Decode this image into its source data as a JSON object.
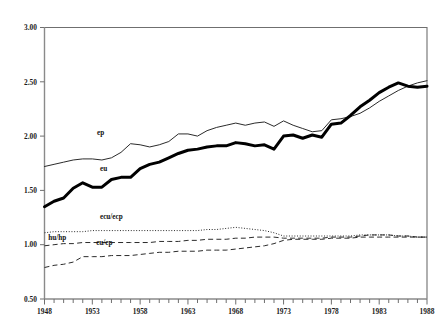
{
  "chart_data": {
    "type": "line",
    "title": "",
    "subtitle": "",
    "xlabel": "",
    "ylabel": "",
    "xlim": [
      1948,
      1988
    ],
    "ylim": [
      0.5,
      3.0
    ],
    "grid": false,
    "legend_position": "inline-labels",
    "y_ticks": [
      "0.50",
      "1.00",
      "1.50",
      "2.00",
      "2.50",
      "3.00"
    ],
    "y_tick_values": [
      0.5,
      1.0,
      1.5,
      2.0,
      2.5,
      3.0
    ],
    "x_ticks": [
      "1948",
      "1953",
      "1958",
      "1963",
      "1968",
      "1973",
      "1978",
      "1983",
      "1988"
    ],
    "x_tick_values": [
      1948,
      1953,
      1958,
      1963,
      1968,
      1973,
      1978,
      1983,
      1988
    ],
    "x_minor_tick_step": 1,
    "x": [
      1948,
      1949,
      1950,
      1951,
      1952,
      1953,
      1954,
      1955,
      1956,
      1957,
      1958,
      1959,
      1960,
      1961,
      1962,
      1963,
      1964,
      1965,
      1966,
      1967,
      1968,
      1969,
      1970,
      1971,
      1972,
      1973,
      1974,
      1975,
      1976,
      1977,
      1978,
      1979,
      1980,
      1981,
      1982,
      1983,
      1984,
      1985,
      1986,
      1987,
      1988
    ],
    "series": [
      {
        "name": "ep",
        "label": "ep",
        "style": "thin-solid",
        "color": "#2b2b2b",
        "label_x": 1953.5,
        "label_y": 2.01,
        "values": [
          1.72,
          1.74,
          1.76,
          1.78,
          1.79,
          1.79,
          1.78,
          1.8,
          1.85,
          1.93,
          1.92,
          1.9,
          1.92,
          1.95,
          2.02,
          2.02,
          2.0,
          2.05,
          2.08,
          2.1,
          2.12,
          2.1,
          2.12,
          2.13,
          2.09,
          2.14,
          2.1,
          2.07,
          2.04,
          2.05,
          2.15,
          2.16,
          2.18,
          2.21,
          2.26,
          2.32,
          2.37,
          2.42,
          2.46,
          2.49,
          2.51
        ]
      },
      {
        "name": "eu",
        "label": "eu",
        "style": "thick-solid",
        "color": "#000000",
        "label_x": 1953.8,
        "label_y": 1.68,
        "values": [
          1.35,
          1.4,
          1.43,
          1.52,
          1.57,
          1.53,
          1.53,
          1.6,
          1.62,
          1.62,
          1.7,
          1.74,
          1.76,
          1.8,
          1.84,
          1.87,
          1.88,
          1.9,
          1.91,
          1.91,
          1.94,
          1.93,
          1.91,
          1.92,
          1.88,
          2.0,
          2.01,
          1.98,
          2.01,
          1.99,
          2.11,
          2.12,
          2.19,
          2.27,
          2.33,
          2.4,
          2.45,
          2.49,
          2.46,
          2.45,
          2.46
        ]
      },
      {
        "name": "ecu/ecp",
        "label": "ecu/ecp",
        "style": "dotted",
        "color": "#2b2b2b",
        "label_x": 1953.8,
        "label_y": 1.24,
        "values": [
          1.11,
          1.12,
          1.12,
          1.12,
          1.12,
          1.13,
          1.13,
          1.13,
          1.13,
          1.13,
          1.13,
          1.13,
          1.13,
          1.13,
          1.13,
          1.13,
          1.13,
          1.14,
          1.14,
          1.15,
          1.16,
          1.15,
          1.14,
          1.13,
          1.11,
          1.08,
          1.08,
          1.08,
          1.08,
          1.08,
          1.08,
          1.08,
          1.08,
          1.09,
          1.09,
          1.09,
          1.09,
          1.08,
          1.08,
          1.07,
          1.07
        ]
      },
      {
        "name": "hu/hp",
        "label": "hu/hp",
        "style": "dashed",
        "color": "#2b2b2b",
        "label_x": 1948.4,
        "label_y": 1.045,
        "values": [
          0.99,
          1.0,
          1.01,
          1.01,
          1.02,
          1.02,
          1.02,
          1.02,
          1.02,
          1.02,
          1.02,
          1.02,
          1.03,
          1.03,
          1.03,
          1.04,
          1.04,
          1.05,
          1.05,
          1.05,
          1.06,
          1.06,
          1.07,
          1.07,
          1.07,
          1.06,
          1.06,
          1.06,
          1.06,
          1.06,
          1.07,
          1.07,
          1.07,
          1.08,
          1.09,
          1.09,
          1.09,
          1.08,
          1.08,
          1.07,
          1.07
        ]
      },
      {
        "name": "eu/ep",
        "label": "eu/ep",
        "style": "dashed",
        "color": "#2b2b2b",
        "label_x": 1953.4,
        "label_y": 1.0,
        "values": [
          0.79,
          0.81,
          0.82,
          0.84,
          0.89,
          0.89,
          0.89,
          0.9,
          0.9,
          0.9,
          0.91,
          0.92,
          0.93,
          0.93,
          0.94,
          0.94,
          0.94,
          0.95,
          0.95,
          0.95,
          0.96,
          0.97,
          0.98,
          0.99,
          1.01,
          1.04,
          1.05,
          1.05,
          1.05,
          1.05,
          1.06,
          1.06,
          1.06,
          1.07,
          1.07,
          1.07,
          1.07,
          1.07,
          1.07,
          1.07,
          1.07
        ]
      }
    ]
  }
}
